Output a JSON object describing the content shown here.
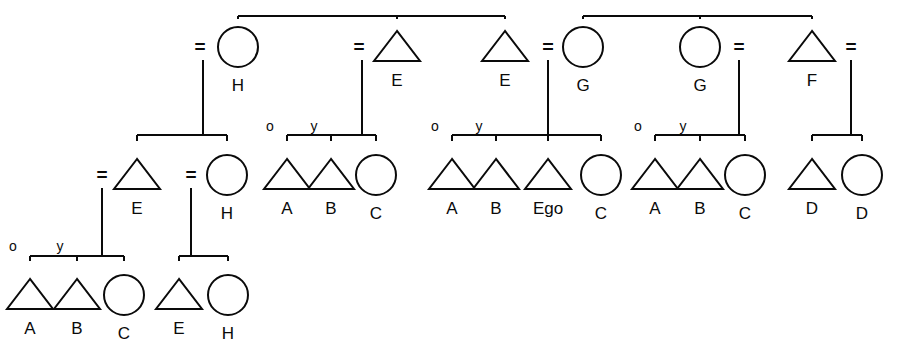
{
  "diagram": {
    "type": "genealogical-kinship-diagram",
    "stroke_color": "#0a0a0a",
    "background_color": "#ffffff",
    "symbol_legend": {
      "triangle": "male",
      "circle": "female",
      "equals": "marriage / union",
      "o": "older sibling",
      "y": "younger sibling"
    },
    "generations": [
      {
        "id": "gen1",
        "row_y": 47,
        "nodes": [
          {
            "id": "g1n1",
            "shape": "circle",
            "label": "H",
            "x": 238,
            "spouse_marker": "=",
            "spouse_marker_x": 200
          },
          {
            "id": "g1n2",
            "shape": "triangle",
            "label": "E",
            "x": 397,
            "spouse_marker": "=",
            "spouse_marker_x": 359
          },
          {
            "id": "g1n3",
            "shape": "triangle",
            "label": "E",
            "x": 505,
            "spouse_marker": "=",
            "spouse_marker_x": 548
          },
          {
            "id": "g1n4",
            "shape": "circle",
            "label": "G",
            "x": 583,
            "spouse_marker": "=",
            "spouse_marker_x": 548
          },
          {
            "id": "g1n5",
            "shape": "circle",
            "label": "G",
            "x": 700,
            "spouse_marker": "=",
            "spouse_marker_x": 739
          },
          {
            "id": "g1n6",
            "shape": "triangle",
            "label": "F",
            "x": 812,
            "spouse_marker": "=",
            "spouse_marker_x": 851
          }
        ],
        "sibling_bars": [
          {
            "id": "bar1",
            "y": 16,
            "x1": 238,
            "x2": 505,
            "children_x": [
              238,
              397,
              505
            ]
          },
          {
            "id": "bar2",
            "y": 16,
            "x1": 583,
            "x2": 812,
            "children_x": [
              583,
              700,
              812
            ]
          }
        ]
      },
      {
        "id": "gen2",
        "row_y": 175,
        "nodes": [
          {
            "id": "g2n1",
            "shape": "triangle",
            "label": "E",
            "x": 137,
            "spouse_marker": "=",
            "spouse_marker_x": 102
          },
          {
            "id": "g2n2",
            "shape": "circle",
            "label": "H",
            "x": 227,
            "spouse_marker": "=",
            "spouse_marker_x": 191
          },
          {
            "id": "g2n3",
            "shape": "triangle",
            "label": "A",
            "x": 287,
            "order_mark": "o"
          },
          {
            "id": "g2n4",
            "shape": "triangle",
            "label": "B",
            "x": 331,
            "order_mark": "y"
          },
          {
            "id": "g2n5",
            "shape": "circle",
            "label": "C",
            "x": 376
          },
          {
            "id": "g2n6",
            "shape": "triangle",
            "label": "A",
            "x": 452,
            "order_mark": "o"
          },
          {
            "id": "g2n7",
            "shape": "triangle",
            "label": "B",
            "x": 496,
            "order_mark": "y"
          },
          {
            "id": "g2n8",
            "shape": "triangle",
            "label": "Ego",
            "x": 548
          },
          {
            "id": "g2n9",
            "shape": "circle",
            "label": "C",
            "x": 601
          },
          {
            "id": "g2n10",
            "shape": "triangle",
            "label": "A",
            "x": 655,
            "order_mark": "o"
          },
          {
            "id": "g2n11",
            "shape": "triangle",
            "label": "B",
            "x": 700,
            "order_mark": "y"
          },
          {
            "id": "g2n12",
            "shape": "circle",
            "label": "C",
            "x": 745
          },
          {
            "id": "g2n13",
            "shape": "triangle",
            "label": "D",
            "x": 812
          },
          {
            "id": "g2n14",
            "shape": "circle",
            "label": "D",
            "x": 862
          }
        ],
        "sibling_bars": [
          {
            "id": "bar3",
            "y": 135,
            "x1": 137,
            "x2": 227,
            "parent_drop_x": 203,
            "children_x": [
              137,
              227
            ]
          },
          {
            "id": "bar4",
            "y": 135,
            "x1": 287,
            "x2": 376,
            "parent_drop_x": 362,
            "children_x": [
              287,
              331,
              376
            ]
          },
          {
            "id": "bar5",
            "y": 135,
            "x1": 452,
            "x2": 601,
            "parent_drop_x": 548,
            "children_x": [
              452,
              496,
              548,
              601
            ]
          },
          {
            "id": "bar6",
            "y": 135,
            "x1": 655,
            "x2": 745,
            "parent_drop_x": 739,
            "children_x": [
              655,
              700,
              745
            ]
          },
          {
            "id": "bar7",
            "y": 135,
            "x1": 812,
            "x2": 862,
            "parent_drop_x": 851,
            "children_x": [
              812,
              862
            ]
          }
        ]
      },
      {
        "id": "gen3",
        "row_y": 295,
        "nodes": [
          {
            "id": "g3n1",
            "shape": "triangle",
            "label": "A",
            "x": 30,
            "order_mark": "o"
          },
          {
            "id": "g3n2",
            "shape": "triangle",
            "label": "B",
            "x": 77,
            "order_mark": "y"
          },
          {
            "id": "g3n3",
            "shape": "circle",
            "label": "C",
            "x": 124
          },
          {
            "id": "g3n4",
            "shape": "triangle",
            "label": "E",
            "x": 179
          },
          {
            "id": "g3n5",
            "shape": "circle",
            "label": "H",
            "x": 228
          }
        ],
        "sibling_bars": [
          {
            "id": "bar8",
            "y": 256,
            "x1": 30,
            "x2": 124,
            "parent_drop_x": 102,
            "children_x": [
              30,
              77,
              124
            ]
          },
          {
            "id": "bar9",
            "y": 256,
            "x1": 179,
            "x2": 228,
            "parent_drop_x": 191,
            "children_x": [
              179,
              228
            ]
          }
        ]
      }
    ],
    "descent_lines": [
      {
        "id": "d1",
        "x": 203,
        "y1": 60,
        "y2": 135
      },
      {
        "id": "d2",
        "x": 362,
        "y1": 60,
        "y2": 135
      },
      {
        "id": "d3",
        "x": 548,
        "y1": 60,
        "y2": 135
      },
      {
        "id": "d4",
        "x": 739,
        "y1": 60,
        "y2": 135
      },
      {
        "id": "d5",
        "x": 851,
        "y1": 60,
        "y2": 135
      },
      {
        "id": "d6",
        "x": 102,
        "y1": 188,
        "y2": 256
      },
      {
        "id": "d7",
        "x": 191,
        "y1": 188,
        "y2": 256
      }
    ]
  }
}
